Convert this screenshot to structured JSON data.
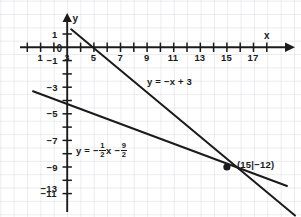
{
  "figure": {
    "corner_mark": ")",
    "background_color": "#ffffff",
    "grid_color": "#d2d6dc",
    "axis_color": "#1b1b1b",
    "line_color": "#1b1b1b"
  },
  "axes": {
    "x_axis_label": "x",
    "y_axis_label": "y",
    "origin_label": "0",
    "x_tick_labels": [
      "1",
      "3",
      "5",
      "7",
      "9",
      "11",
      "13",
      "15",
      "17"
    ],
    "y_tick_labels": [
      "1",
      "−1",
      "−3",
      "−5",
      "−7",
      "−9",
      "−11",
      "−13"
    ]
  },
  "labels": {
    "equation_1": "y = −x + 3",
    "equation_2_prefix": "y = −",
    "equation_2_mid": "x −",
    "fraction_1_num": "1",
    "fraction_1_den": "2",
    "fraction_2_num": "9",
    "fraction_2_den": "2",
    "intersection_point": "(15|−12)"
  },
  "chart_data": {
    "type": "line",
    "title": "",
    "xlabel": "x",
    "ylabel": "y",
    "xlim": [
      -2,
      19
    ],
    "ylim": [
      -14.5,
      2.5
    ],
    "grid": true,
    "legend": "inline-annotations",
    "x_ticks": [
      1,
      3,
      5,
      7,
      9,
      11,
      13,
      15,
      17
    ],
    "y_ticks": [
      1,
      -1,
      -3,
      -5,
      -7,
      -9,
      -11,
      -13
    ],
    "x_tick_step_minor": 1,
    "y_tick_step_minor": 2,
    "series": [
      {
        "name": "y = −x + 3",
        "equation": "y = -x + 3",
        "slope": -1,
        "intercept": 3,
        "x_start": 0.3,
        "x_end": 17.2,
        "y_start": 2.7,
        "y_end": -14.2
      },
      {
        "name": "y = −(1/2)x − 9/2",
        "equation": "y = -0.5x - 4.5",
        "slope": -0.5,
        "intercept": -4.5,
        "x_start": -2.5,
        "x_end": 17.4,
        "y_start": -3.25,
        "y_end": -13.2
      }
    ],
    "annotations": [
      {
        "text": "y = −x + 3",
        "x": 8.2,
        "y": -5.2
      },
      {
        "text": "y = −(1/2)x − 9/2",
        "x": 2.1,
        "y": -9.6
      },
      {
        "text": "(15|−12)",
        "x": 16.0,
        "y": -10.7
      }
    ],
    "points": [
      {
        "label": "(15|−12)",
        "x": 15,
        "y": -12,
        "marker": "dot",
        "is_intersection": true
      }
    ]
  }
}
